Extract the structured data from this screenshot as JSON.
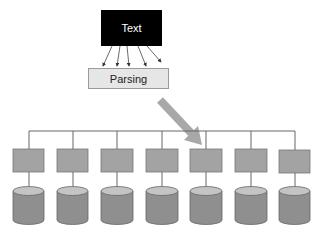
{
  "diagram": {
    "source_node": {
      "label": "Text"
    },
    "parser_node": {
      "label": "Parsing"
    },
    "source_arrow_count": 5,
    "colors": {
      "source_fill": "#000000",
      "parser_fill": "#e6e6e6",
      "node_fill": "#a3a3a3",
      "cylinder_body": "#8f8f8f",
      "cylinder_top": "#c4c4c4",
      "big_arrow": "#a8a8a8",
      "line": "#555555"
    },
    "partition_nodes": [
      {
        "index": 1
      },
      {
        "index": 2
      },
      {
        "index": 3
      },
      {
        "index": 4
      },
      {
        "index": 5
      },
      {
        "index": 6
      },
      {
        "index": 7
      }
    ],
    "storage_nodes": [
      {
        "index": 1
      },
      {
        "index": 2
      },
      {
        "index": 3
      },
      {
        "index": 4
      },
      {
        "index": 5
      },
      {
        "index": 6
      },
      {
        "index": 7
      }
    ]
  }
}
